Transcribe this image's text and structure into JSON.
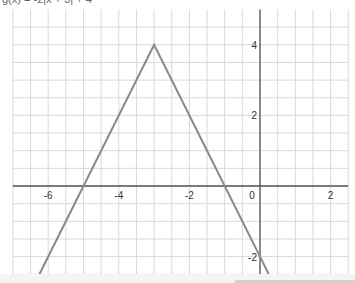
{
  "title": "g(x) = -2|x + 3| + 4",
  "chart_data": {
    "type": "line",
    "title": "g(x) = -2|x + 3| + 4",
    "function": "g(x) = -2|x + 3| + 4",
    "xlabel": "",
    "ylabel": "",
    "xlim": [
      -7,
      2.5
    ],
    "ylim": [
      -2.5,
      5
    ],
    "grid": true,
    "grid_step": 0.5,
    "x_ticks": [
      -6,
      -4,
      -2,
      0,
      2
    ],
    "x_tick_labels": [
      "-6",
      "-4",
      "-2",
      "0",
      "2"
    ],
    "y_ticks": [
      4,
      2,
      -2
    ],
    "y_tick_labels": [
      "4",
      "2",
      "-2"
    ],
    "series": [
      {
        "name": "g(x)",
        "color": "#8a8a8a",
        "points": [
          {
            "x": -6.25,
            "y": -2.5
          },
          {
            "x": -5,
            "y": 0
          },
          {
            "x": -3,
            "y": 4
          },
          {
            "x": -1,
            "y": 0
          },
          {
            "x": 0,
            "y": -2
          },
          {
            "x": 0.25,
            "y": -2.5
          }
        ]
      }
    ],
    "key_points": {
      "vertex": [
        -3,
        4
      ],
      "x_intercepts": [
        [
          -5,
          0
        ],
        [
          -1,
          0
        ]
      ],
      "y_intercept": [
        0,
        -2
      ]
    }
  },
  "colors": {
    "grid": "#d9d9d9",
    "axis": "#555555",
    "curve": "#8a8a8a",
    "label": "#333333"
  }
}
